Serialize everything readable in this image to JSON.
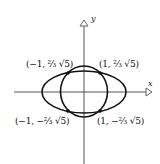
{
  "diagram": {
    "axes": {
      "x_label": "x",
      "y_label": "y"
    },
    "curves": [
      {
        "name": "circle",
        "description": "circle centered at origin"
      },
      {
        "name": "ellipse",
        "description": "horizontally elongated ellipse centered at origin"
      }
    ],
    "intersection_points": [
      {
        "id": "top-left",
        "label": "(−1, ⅔ √5)"
      },
      {
        "id": "top-right",
        "label": "(1, ⅔ √5)"
      },
      {
        "id": "bottom-left",
        "label": "(−1, −⅔ √5)"
      },
      {
        "id": "bottom-right",
        "label": "(1, −⅔ √5)"
      }
    ],
    "colors": {
      "stroke": "#111111",
      "axis": "#555555",
      "background": "#ffffff"
    }
  }
}
